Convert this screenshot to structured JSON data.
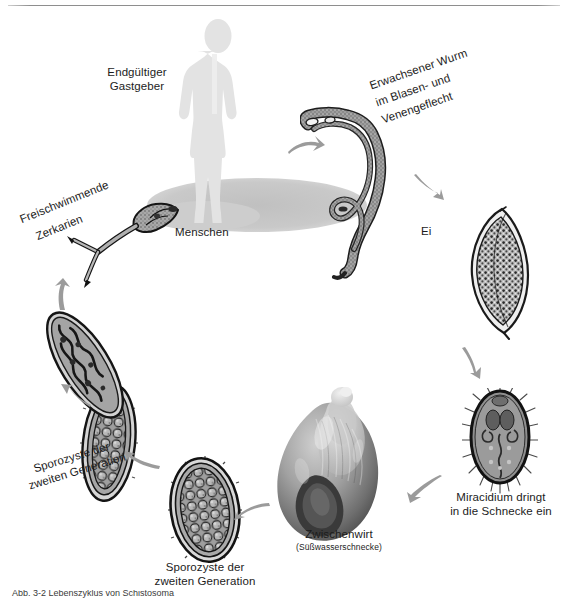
{
  "figure": {
    "title": "Lebenszyklus von Schistosoma",
    "background_color": "#ffffff",
    "rule_color": "#8e8e8e"
  },
  "labels": {
    "definitive_host_line1": "Endgültiger",
    "definitive_host_line2": "Gastgeber",
    "humans": "Menschen",
    "adult_worm_line1": "Erwachsener Wurm",
    "adult_worm_line2": "im Blasen- und",
    "adult_worm_line3": "Venengeflecht",
    "egg": "Ei",
    "miracidium_line1": "Miracidium dringt",
    "miracidium_line2": "in die Schnecke ein",
    "intermediate_host": "Zwischenwirt",
    "intermediate_host_sub": "(Süßwasserschnecke)",
    "sporocyst2_center_line1": "Sporozyste der",
    "sporocyst2_center_line2": "zweiten Generation",
    "sporocyst2_left_line1": "Sporozyste der",
    "sporocyst2_left_line2": "zweiten Generation",
    "cercariae_line1": "Freischwimmende",
    "cercariae_line2": "Zerkarien"
  },
  "caption": {
    "text": "Abb. 3-2 Lebenszyklus von Schistosoma"
  },
  "colors": {
    "human_silhouette": "#e2e2e2",
    "ground_ellipse": "#c8c8c8",
    "arrow": "#9a9a9a",
    "organism_outline": "#1e1e1e",
    "organism_fill": "#9c9c9c",
    "text": "#1c1c1c"
  },
  "cycle_stages": [
    {
      "name": "definitive-host-human",
      "label": "Endgültiger Gastgeber"
    },
    {
      "name": "adult-worm",
      "label": "Erwachsener Wurm im Blasen- und Venengeflecht"
    },
    {
      "name": "egg",
      "label": "Ei"
    },
    {
      "name": "miracidium",
      "label": "Miracidium dringt in die Schnecke ein"
    },
    {
      "name": "intermediate-host-snail",
      "label": "Zwischenwirt (Süßwasserschnecke)"
    },
    {
      "name": "sporocyst-second-generation-center",
      "label": "Sporozyste der zweiten Generation"
    },
    {
      "name": "sporocyst-second-generation-left",
      "label": "Sporozyste der zweiten Generation"
    },
    {
      "name": "cercariae",
      "label": "Freischwimmende Zerkarien"
    }
  ]
}
